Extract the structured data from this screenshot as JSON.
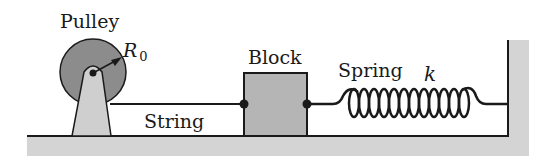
{
  "labels": {
    "pulley": "Pulley",
    "radius": "R",
    "radius_sub": "0",
    "block": "Block",
    "string": "String",
    "spring": "Spring",
    "spring_constant": "k"
  },
  "colors": {
    "pulley_fill": "#8c8c8c",
    "support_fill": "#cfcfcf",
    "block_fill": "#b5b5b5",
    "ground_fill": "#d4d4d4",
    "line": "#1a1a1a"
  }
}
